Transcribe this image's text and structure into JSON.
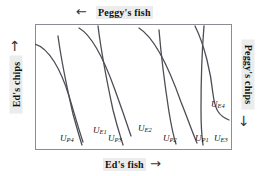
{
  "figure": {
    "type": "edgeworth-box-diagram",
    "title": "",
    "box": {
      "stroke": "#8c8c96",
      "fill": "#ffffff"
    },
    "curve_color": "#4d4d55",
    "label_background": "#ececec"
  },
  "axes": {
    "top": {
      "text": "Peggy's fish",
      "arrow": "←",
      "arrow_name": "left-arrow"
    },
    "bottom": {
      "text": "Ed's fish",
      "arrow": "→",
      "arrow_name": "right-arrow"
    },
    "left": {
      "text": "Ed's chips",
      "arrow": "↑",
      "arrow_name": "up-arrow"
    },
    "right": {
      "text": "Peggy's chips",
      "arrow": "↓",
      "arrow_name": "down-arrow"
    }
  },
  "curve_labels": [
    {
      "id": "UP4",
      "base": "U",
      "sub": "P4",
      "owner": "peggy",
      "x": 25,
      "y": 110
    },
    {
      "id": "UE1",
      "base": "U",
      "sub": "E1",
      "owner": "ed",
      "x": 58,
      "y": 102
    },
    {
      "id": "UP3",
      "base": "U",
      "sub": "P3",
      "owner": "peggy",
      "x": 73,
      "y": 110
    },
    {
      "id": "UE2",
      "base": "U",
      "sub": "E2",
      "owner": "ed",
      "x": 103,
      "y": 100
    },
    {
      "id": "UP2",
      "base": "U",
      "sub": "P2",
      "owner": "peggy",
      "x": 128,
      "y": 110
    },
    {
      "id": "UP1",
      "base": "U",
      "sub": "P1",
      "owner": "peggy",
      "x": 160,
      "y": 110
    },
    {
      "id": "UE3",
      "base": "U",
      "sub": "E3",
      "owner": "ed",
      "x": 179,
      "y": 110
    },
    {
      "id": "UE4",
      "base": "U",
      "sub": "E4",
      "owner": "ed",
      "x": 176,
      "y": 76
    }
  ],
  "chart_data": {
    "type": "line",
    "title": "",
    "xlabel": "Ed's fish",
    "ylabel": "Ed's chips",
    "xlabel_secondary": "Peggy's fish",
    "ylabel_secondary": "Peggy's chips",
    "grid": false,
    "legend": "none",
    "xlim": [
      0,
      197
    ],
    "ylim": [
      0,
      126
    ],
    "note": "Edgeworth box with four Ed indifference curves (convex to Ed's origin at lower-left) and four Peggy indifference curves (steep, convex to Peggy's origin at upper-right).",
    "series": [
      {
        "name": "UE1",
        "owner": "ed",
        "path": "M 0,20 C 14,24 26,46 34,72 C 40,92 44,106 48,118"
      },
      {
        "name": "UE2",
        "owner": "ed",
        "path": "M 44,4 C 58,12 70,38 80,66 C 88,88 92,100 96,112"
      },
      {
        "name": "UE3",
        "owner": "ed",
        "path": "M 104,4 C 120,14 134,44 146,78 C 154,98 158,110 162,119"
      },
      {
        "name": "UE4",
        "owner": "ed",
        "path": "M 160,2 C 170,22 176,50 178,70 C 180,86 184,92 194,96"
      },
      {
        "name": "UP1",
        "owner": "peggy",
        "path": "M 169,2 C 167,26 166,58 166,86 C 166,104 167,114 168,121"
      },
      {
        "name": "UP2",
        "owner": "peggy",
        "path": "M 124,6 C 126,30 130,62 134,88 C 137,106 139,114 141,120"
      },
      {
        "name": "UP3",
        "owner": "peggy",
        "path": "M 63,2 C 66,26 72,58 78,86 C 83,106 86,114 88,121"
      },
      {
        "name": "UP4",
        "owner": "peggy",
        "path": "M 23,12 C 26,34 32,64 38,90 C 43,108 45,115 47,121"
      }
    ]
  }
}
